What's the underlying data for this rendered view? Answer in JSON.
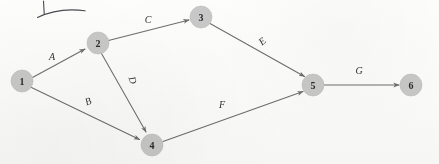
{
  "figure": {
    "type": "directed-graph",
    "background_color": "#fdfdfc",
    "node_fill_color": "#c9c9c9",
    "node_text_color": "#2b2b2b",
    "edge_color": "#6e6e70",
    "label_color": "#333336",
    "annotation_color": "#4a4a52"
  },
  "nodes": [
    {
      "id": "1",
      "label": "1",
      "x": 22,
      "y": 81,
      "r": 11
    },
    {
      "id": "2",
      "label": "2",
      "x": 98,
      "y": 43,
      "r": 11
    },
    {
      "id": "3",
      "label": "3",
      "x": 201,
      "y": 17,
      "r": 11
    },
    {
      "id": "4",
      "label": "4",
      "x": 152,
      "y": 145,
      "r": 11
    },
    {
      "id": "5",
      "label": "5",
      "x": 313,
      "y": 85,
      "r": 11
    },
    {
      "id": "6",
      "label": "6",
      "x": 411,
      "y": 85,
      "r": 11
    }
  ],
  "edges": [
    {
      "id": "A",
      "label": "A",
      "from": "1",
      "to": "2",
      "label_x": 52,
      "label_y": 56,
      "label_rotation": 0
    },
    {
      "id": "B",
      "label": "B",
      "from": "1",
      "to": "4",
      "label_x": 88,
      "label_y": 101,
      "label_rotation": -22
    },
    {
      "id": "C",
      "label": "C",
      "from": "2",
      "to": "3",
      "label_x": 148,
      "label_y": 19,
      "label_rotation": 0
    },
    {
      "id": "D",
      "label": "D",
      "from": "2",
      "to": "4",
      "label_x": 133,
      "label_y": 80,
      "label_rotation": 72
    },
    {
      "id": "E",
      "label": "E",
      "from": "3",
      "to": "5",
      "label_x": 262,
      "label_y": 41,
      "label_rotation": -40
    },
    {
      "id": "F",
      "label": "F",
      "from": "4",
      "to": "5",
      "label_x": 222,
      "label_y": 104,
      "label_rotation": 0
    },
    {
      "id": "G",
      "label": "G",
      "from": "5",
      "to": "6",
      "label_x": 359,
      "label_y": 70,
      "label_rotation": 0
    }
  ],
  "annotations": [
    {
      "id": "pen-stroke-vertical",
      "name": "handwritten-vertical-stroke"
    },
    {
      "id": "pen-stroke-underline",
      "name": "handwritten-curved-underline"
    }
  ]
}
